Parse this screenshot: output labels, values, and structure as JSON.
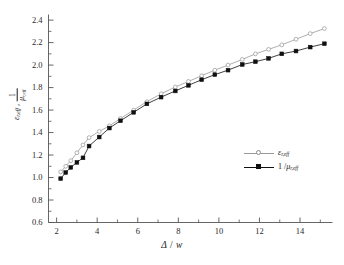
{
  "chart_data": {
    "type": "line",
    "title": "",
    "xlabel": "Δ / w",
    "ylabel": "εr,eff , 1/μr,eff",
    "xlim": [
      1.6,
      15.6
    ],
    "ylim": [
      0.6,
      2.45
    ],
    "xticks": [
      2,
      4,
      6,
      8,
      10,
      12,
      14
    ],
    "yticks": [
      0.6,
      0.8,
      1.0,
      1.2,
      1.4,
      1.6,
      1.8,
      2.0,
      2.2,
      2.4
    ],
    "grid": false,
    "legend_position": "center-right",
    "x": [
      2.2,
      2.45,
      2.7,
      3.0,
      3.3,
      3.6,
      4.1,
      4.6,
      5.15,
      5.8,
      6.45,
      7.15,
      7.85,
      8.5,
      9.15,
      9.8,
      10.45,
      11.15,
      11.8,
      12.45,
      13.1,
      13.8,
      14.5,
      15.2
    ],
    "series": [
      {
        "name": "εr,eff",
        "marker": "open-circle",
        "color": "#9a9a9a",
        "values": [
          1.05,
          1.1,
          1.15,
          1.22,
          1.29,
          1.355,
          1.41,
          1.46,
          1.525,
          1.6,
          1.675,
          1.745,
          1.805,
          1.855,
          1.905,
          1.955,
          2.0,
          2.05,
          2.1,
          2.14,
          2.18,
          2.23,
          2.28,
          2.325
        ]
      },
      {
        "name": "1/μr,eff",
        "marker": "filled-square",
        "color": "#101010",
        "values": [
          0.99,
          1.045,
          1.09,
          1.135,
          1.175,
          1.28,
          1.36,
          1.44,
          1.505,
          1.58,
          1.655,
          1.715,
          1.77,
          1.82,
          1.87,
          1.915,
          1.955,
          2.005,
          2.03,
          2.06,
          2.1,
          2.125,
          2.16,
          2.19
        ]
      }
    ]
  },
  "axes": {
    "y_title": {
      "eps": "ε",
      "eps_sub": "r,eff",
      "comma": " ,",
      "frac_num": "1",
      "frac_den_mu": "μ",
      "frac_den_sub": "r,eff"
    },
    "x_title": {
      "delta": "Δ",
      "slash": " / ",
      "w": "w"
    },
    "ytick_labels": [
      "2.4",
      "2.2",
      "2.0",
      "1.8",
      "1.6",
      "1.4",
      "1.2",
      "1.0",
      "0.8",
      "0.6"
    ],
    "xtick_labels": [
      "2",
      "4",
      "6",
      "8",
      "10",
      "12",
      "14"
    ]
  },
  "legend": {
    "entries": [
      {
        "symbol": "ε",
        "sub": "r,eff",
        "prefix": "",
        "marker": "open-circle"
      },
      {
        "symbol": "μ",
        "sub": "r,eff",
        "prefix": "1 /",
        "marker": "filled-square"
      }
    ]
  },
  "caption": ""
}
